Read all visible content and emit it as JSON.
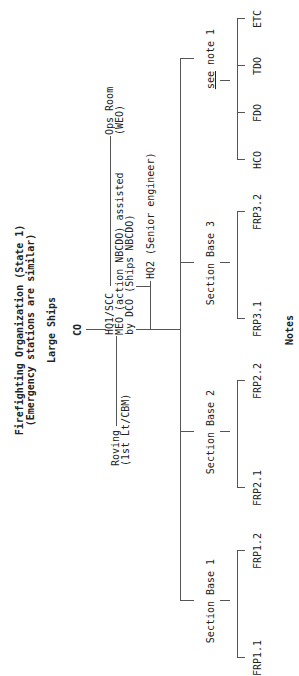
{
  "title": {
    "line1": "Firefighting Organization (State 1)",
    "line2": "(Emergency stations are similar)"
  },
  "subtitle": "Large Ships",
  "top_node": "CO",
  "hq1": {
    "line1": "HQ1/SCC",
    "line2": "MEO (action NBCDO) assisted",
    "line3": "by DCO (Ships NBCDO)"
  },
  "roving": {
    "line1": "Roving",
    "line2": "(1st Lt/CBM)"
  },
  "ops_room": {
    "line1": "Ops Room",
    "line2": "(WEO)"
  },
  "hq2": "HQ2 (Senior engineer)",
  "section_bases": [
    {
      "label": "Section Base 1",
      "children": [
        "FRP1.1",
        "FRP1.2"
      ]
    },
    {
      "label": "Section Base 2",
      "children": [
        "FRP2.1",
        "FRP2.2"
      ]
    },
    {
      "label": "Section Base 3",
      "children": [
        "FRP3.1",
        "FRP3.2"
      ]
    }
  ],
  "note_branch": {
    "see": "see",
    "note": " note 1",
    "children": [
      "HCO",
      "FDO",
      "TDO",
      "ETC"
    ]
  },
  "notes_heading": "Notes"
}
